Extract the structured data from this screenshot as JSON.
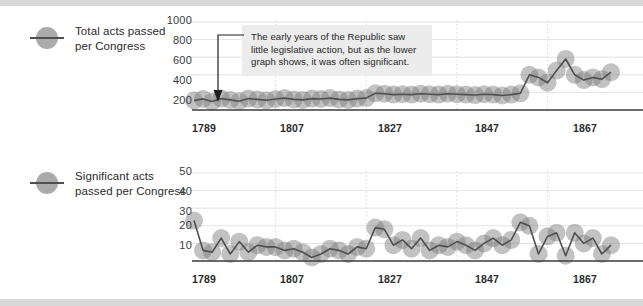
{
  "theme": {
    "page_bg": "#ffffff",
    "outer_bg": "#d8d8d8",
    "line_color": "#4f4f4f",
    "bubble_color": "rgba(120,120,120,0.45)",
    "grid_color": "#e3e3e3",
    "axis_color": "#3b3b3b",
    "annotation_bg": "#ececec",
    "text_color": "#2b2b2b"
  },
  "charts": [
    {
      "legend": {
        "label": "Total acts passed\nper Congress",
        "marker_icon": "circle-with-line-icon"
      },
      "annotation": {
        "text": "The early years of the Republic saw little legislative action, but as the lower graph shows, it was often significant.",
        "arrow_icon": "elbow-arrow-down-icon"
      }
    },
    {
      "legend": {
        "label": "Significant acts\npassed per Congress",
        "marker_icon": "circle-with-line-icon"
      }
    }
  ],
  "chart_data": [
    {
      "type": "line",
      "title": "Total acts passed per Congress",
      "xlabel": "",
      "ylabel": "",
      "ylim": [
        0,
        1000
      ],
      "yticks": [
        200,
        400,
        600,
        800,
        1000
      ],
      "xlim": [
        1789,
        1881
      ],
      "xticks": [
        1789,
        1807,
        1827,
        1847,
        1867
      ],
      "grid": true,
      "legend_position": "left",
      "x": [
        1789,
        1791,
        1793,
        1795,
        1797,
        1799,
        1801,
        1803,
        1805,
        1807,
        1809,
        1811,
        1813,
        1815,
        1817,
        1819,
        1821,
        1823,
        1825,
        1827,
        1829,
        1831,
        1833,
        1835,
        1837,
        1839,
        1841,
        1843,
        1845,
        1847,
        1849,
        1851,
        1853,
        1855,
        1857,
        1859,
        1861,
        1863,
        1865,
        1867,
        1869,
        1871,
        1873,
        1875,
        1877,
        1879,
        1881
      ],
      "values": [
        108,
        126,
        95,
        130,
        115,
        100,
        130,
        120,
        110,
        125,
        135,
        120,
        115,
        130,
        125,
        135,
        120,
        115,
        130,
        135,
        190,
        185,
        175,
        180,
        175,
        185,
        180,
        175,
        185,
        180,
        175,
        170,
        180,
        175,
        165,
        175,
        190,
        400,
        370,
        310,
        450,
        580,
        400,
        340,
        370,
        350,
        430
      ]
    },
    {
      "type": "line",
      "title": "Significant acts passed per Congress",
      "xlabel": "",
      "ylabel": "",
      "ylim": [
        0,
        50
      ],
      "yticks": [
        10,
        20,
        30,
        40,
        50
      ],
      "xlim": [
        1789,
        1881
      ],
      "xticks": [
        1789,
        1807,
        1827,
        1847,
        1867
      ],
      "grid": true,
      "legend_position": "left",
      "x": [
        1789,
        1791,
        1793,
        1795,
        1797,
        1799,
        1801,
        1803,
        1805,
        1807,
        1809,
        1811,
        1813,
        1815,
        1817,
        1819,
        1821,
        1823,
        1825,
        1827,
        1829,
        1831,
        1833,
        1835,
        1837,
        1839,
        1841,
        1843,
        1845,
        1847,
        1849,
        1851,
        1853,
        1855,
        1857,
        1859,
        1861,
        1863,
        1865,
        1867,
        1869,
        1871,
        1873,
        1875,
        1877,
        1879,
        1881
      ],
      "values": [
        23,
        6,
        5,
        13,
        4,
        11,
        5,
        9,
        8,
        8,
        6,
        7,
        5,
        2,
        4,
        7,
        6,
        4,
        8,
        7,
        19,
        18,
        9,
        12,
        7,
        13,
        6,
        9,
        8,
        11,
        9,
        6,
        10,
        13,
        9,
        12,
        22,
        20,
        4,
        14,
        16,
        3,
        16,
        10,
        13,
        4,
        9
      ]
    }
  ]
}
